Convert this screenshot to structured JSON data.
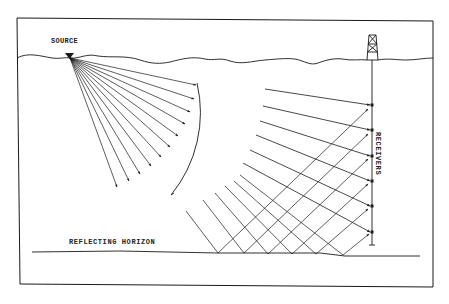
{
  "diagram": {
    "labels": {
      "source": "SOURCE",
      "reflecting_horizon": "REFLECTING HORIZON",
      "receivers": "RECEIVERS"
    },
    "colors": {
      "ink": "#1a1a1a",
      "background": "#ffffff"
    },
    "elements": {
      "frame": "rectangular border",
      "surface": "wavy ground surface line",
      "source": "inverted triangle marker at surface (left)",
      "derrick": "drilling rig at surface (right)",
      "well": "vertical borehole below derrick",
      "receiver_count": 6,
      "fan_rays": "direct rays radiating from source to a circular wavefront arc",
      "direct_rays": "downgoing rays continuing to receivers",
      "reflected_rays": "upgoing rays from reflecting horizon to receivers"
    }
  }
}
